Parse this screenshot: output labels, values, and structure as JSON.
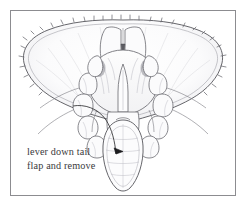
{
  "figure": {
    "kind": "line-drawing",
    "title": "lever down tail flap and remove",
    "frame": {
      "border_color": "#8c8c90",
      "background_color": "#ffffff"
    },
    "ink": {
      "outline_color": "#55555a",
      "shading_color": "#a9a9b0",
      "arrow_color": "#3a3a3c",
      "text_color": "#3a3a3c"
    },
    "caption": {
      "line1": "lever down tail",
      "line2": "flap and remove"
    },
    "annotations": {
      "arrow": "curved-arrow-pointing-to-tail-flap",
      "arrowhead": "solid-triangle"
    },
    "parts": [
      "carapace-shell",
      "serrated-shell-rim",
      "body-underside",
      "left-legs",
      "right-legs",
      "tail-flap-apron"
    ]
  }
}
